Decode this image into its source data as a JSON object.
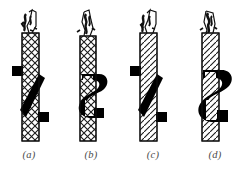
{
  "figure": {
    "background_color": "#ffffff",
    "ink_color": "#000000",
    "caption_color": "#4a4a4a",
    "panel_count": 4,
    "panels": [
      {
        "id": "a",
        "caption": "(a)",
        "caption_x": 27,
        "cable": {
          "x": 22,
          "y_top": 33,
          "width": 17,
          "y_bottom": 141,
          "hatch": "crossed-braid",
          "frayed_top": true,
          "frayed_top_height": 28
        },
        "fitting": {
          "name": "diagonal-band-clamp",
          "type": "diagonal",
          "tab_upper_side": "left",
          "tab_lower_side": "right",
          "y_top": 72,
          "y_bottom": 120
        }
      },
      {
        "id": "b",
        "caption": "(b)",
        "caption_x": 90,
        "cable": {
          "x": 80,
          "y_top": 36,
          "width": 16,
          "y_bottom": 141,
          "hatch": "crossed-braid",
          "frayed_top": true,
          "frayed_top_height": 28
        },
        "fitting": {
          "name": "s-hook-clamp",
          "type": "s-curve",
          "tab_upper_side": "right",
          "tab_lower_side": "left",
          "y_top": 72,
          "y_bottom": 120
        }
      },
      {
        "id": "c",
        "caption": "(c)",
        "caption_x": 152,
        "cable": {
          "x": 140,
          "y_top": 33,
          "width": 17,
          "y_bottom": 141,
          "hatch": "right-slant",
          "frayed_top": true,
          "frayed_top_height": 28
        },
        "fitting": {
          "name": "diagonal-band-clamp",
          "type": "diagonal",
          "tab_upper_side": "left",
          "tab_lower_side": "right",
          "y_top": 72,
          "y_bottom": 120
        }
      },
      {
        "id": "d",
        "caption": "(d)",
        "caption_x": 214,
        "cable": {
          "x": 202,
          "y_top": 33,
          "width": 17,
          "y_bottom": 141,
          "hatch": "right-slant",
          "frayed_top": true,
          "frayed_top_height": 28
        },
        "fitting": {
          "name": "s-hook-clamp",
          "type": "s-curve",
          "tab_upper_side": "right",
          "tab_lower_side": "left",
          "y_top": 70,
          "y_bottom": 122
        }
      }
    ]
  }
}
